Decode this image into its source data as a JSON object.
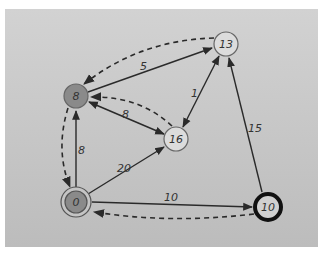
{
  "diagram": {
    "type": "weighted-directed-graph",
    "colors": {
      "background": "#c8c8c8",
      "visited_node_fill": "#8a8a8a",
      "unvisited_node_fill": "#dcdcdc",
      "edge": "#2a2a2a"
    },
    "nodes": [
      {
        "id": "n0",
        "label": "0",
        "x": 76,
        "y": 202,
        "style": "source-double-ring",
        "fill": "#8a8a8a"
      },
      {
        "id": "n8",
        "label": "8",
        "x": 76,
        "y": 96,
        "style": "visited",
        "fill": "#8a8a8a"
      },
      {
        "id": "n13",
        "label": "13",
        "x": 226,
        "y": 44,
        "style": "normal",
        "fill": "#dcdcdc"
      },
      {
        "id": "n16",
        "label": "16",
        "x": 176,
        "y": 139,
        "style": "normal",
        "fill": "#dcdcdc"
      },
      {
        "id": "n10",
        "label": "10",
        "x": 268,
        "y": 207,
        "style": "current-thick-ring",
        "fill": "#d0d0d0"
      }
    ],
    "edges": [
      {
        "from": "0",
        "to": "8",
        "weight": "8",
        "kind": "solid"
      },
      {
        "from": "0",
        "to": "16",
        "weight": "20",
        "kind": "solid"
      },
      {
        "from": "0",
        "to": "10",
        "weight": "10",
        "kind": "solid"
      },
      {
        "from": "8",
        "to": "13",
        "weight": "5",
        "kind": "solid"
      },
      {
        "from": "8",
        "to": "16",
        "weight": "8",
        "kind": "solid-bidirectional"
      },
      {
        "from": "13",
        "to": "16",
        "weight": "1",
        "kind": "solid-bidirectional"
      },
      {
        "from": "10",
        "to": "13",
        "weight": "15",
        "kind": "solid"
      },
      {
        "from": "13",
        "to": "8",
        "weight": "",
        "kind": "dashed-predecessor"
      },
      {
        "from": "16",
        "to": "8",
        "weight": "",
        "kind": "dashed-predecessor"
      },
      {
        "from": "8",
        "to": "0",
        "weight": "",
        "kind": "dashed-predecessor"
      },
      {
        "from": "10",
        "to": "0",
        "weight": "",
        "kind": "dashed-predecessor"
      }
    ],
    "edge_labels": {
      "e_0_8": "8",
      "e_0_16": "20",
      "e_0_10": "10",
      "e_8_13": "5",
      "e_8_16": "8",
      "e_13_16": "1",
      "e_10_13": "15"
    },
    "node_labels": {
      "n0": "0",
      "n8": "8",
      "n13": "13",
      "n16": "16",
      "n10": "10"
    }
  }
}
